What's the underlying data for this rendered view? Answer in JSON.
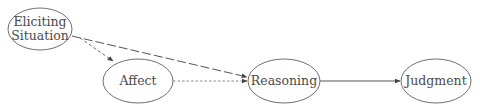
{
  "diagram": {
    "type": "flow",
    "nodes": [
      {
        "id": "situation",
        "label_line1": "Eliciting",
        "label_line2": "Situation",
        "cx": 40,
        "cy": 29,
        "rx": 32,
        "ry": 21
      },
      {
        "id": "affect",
        "label": "Affect",
        "cx": 138,
        "cy": 81,
        "rx": 35,
        "ry": 22
      },
      {
        "id": "reasoning",
        "label": "Reasoning",
        "cx": 284,
        "cy": 81,
        "rx": 36,
        "ry": 22
      },
      {
        "id": "judgment",
        "label": "Judgment",
        "cx": 436,
        "cy": 81,
        "rx": 35,
        "ry": 22
      }
    ],
    "edges": [
      {
        "from": "situation",
        "to": "reasoning",
        "style": "long-dashed"
      },
      {
        "from": "situation",
        "to": "affect",
        "style": "dashed"
      },
      {
        "from": "affect",
        "to": "reasoning",
        "style": "dotted"
      },
      {
        "from": "reasoning",
        "to": "judgment",
        "style": "solid"
      }
    ],
    "colors": {
      "stroke": "#6e6e6e",
      "text": "#4a4a4a",
      "background": "#ffffff"
    }
  }
}
